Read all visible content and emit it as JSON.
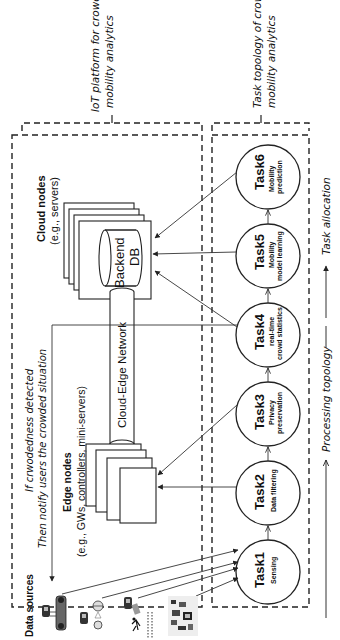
{
  "diagram": {
    "orientation": "rotated -90deg (text reads bottom-to-top)",
    "labels": {
      "iot_platform": [
        "IoT platform for crowd",
        "mobility analytics"
      ],
      "task_topology": [
        "Task topology of crowd",
        "mobility analytics"
      ],
      "cloud_nodes": [
        "Cloud nodes",
        "(e.g., servers)"
      ],
      "backend_db": [
        "Backend",
        "DB"
      ],
      "network": "Cloud-Edge Network",
      "edge_nodes": [
        "Edge nodes",
        "(e.g., GWs, controllers, mini-servers)"
      ],
      "notify": [
        "If crwodedness detected",
        "Then notify users the crowded situation"
      ],
      "data_sources": "Data sources",
      "task_allocation": "Task allocation",
      "processing_topology": "Processing topology"
    },
    "tasks": [
      {
        "id": "Task1",
        "desc": [
          "Sensing"
        ]
      },
      {
        "id": "Task2",
        "desc": [
          "Data filtering"
        ]
      },
      {
        "id": "Task3",
        "desc": [
          "Privacy",
          "preservation"
        ]
      },
      {
        "id": "Task4",
        "desc": [
          "real-time",
          "crowd statistics"
        ]
      },
      {
        "id": "Task5",
        "desc": [
          "Mobility",
          "model learning"
        ]
      },
      {
        "id": "Task6",
        "desc": [
          "Mobility",
          "prediction"
        ]
      }
    ],
    "data_source_icons": [
      "cctv-camera-icon",
      "bus-icon",
      "cctv-camera-icon",
      "wifi-signal-icon",
      "cctv-camera-icon",
      "pedestrian-icon",
      "sensor-board-icon"
    ],
    "colors": {
      "stroke": "#222222",
      "background": "#ffffff",
      "text": "#111111"
    }
  }
}
